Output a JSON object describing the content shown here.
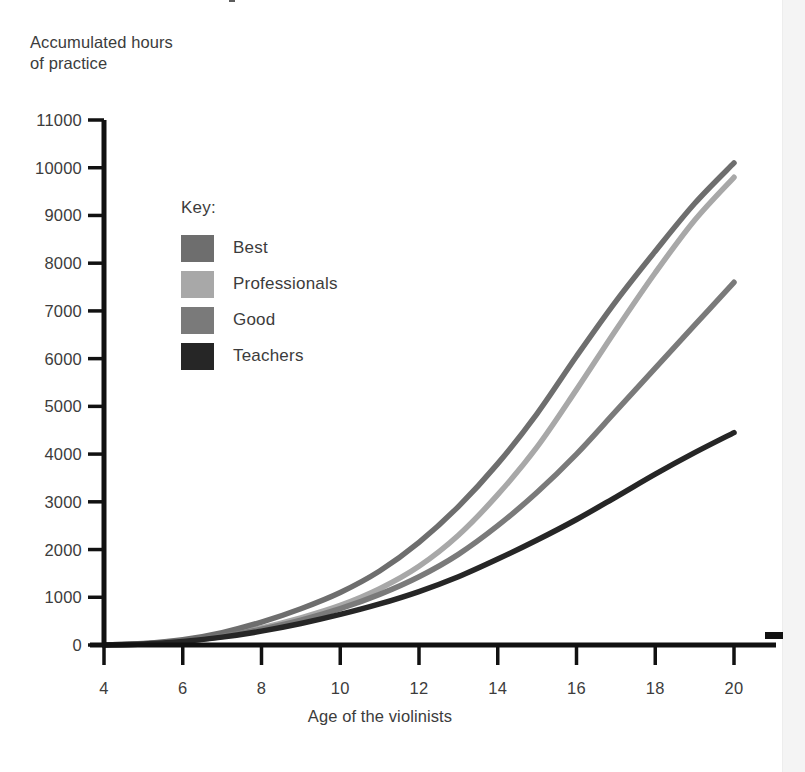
{
  "y_axis_title": "Accumulated hours\nof practice",
  "x_axis_title": "Age of the violinists",
  "legend": {
    "title": "Key:",
    "items": [
      {
        "label": "Best",
        "color": "#6e6e6e"
      },
      {
        "label": "Professionals",
        "color": "#a8a8a8"
      },
      {
        "label": "Good",
        "color": "#7a7a7a"
      },
      {
        "label": "Teachers",
        "color": "#262626"
      }
    ]
  },
  "colors": {
    "axis": "#111111",
    "text": "#3c3c3c",
    "background": "#ffffff",
    "gutter": "#f4f4f4"
  },
  "chart_data": {
    "type": "line",
    "title": "",
    "xlabel": "Age of the violinists",
    "ylabel": "Accumulated hours of practice",
    "xlim": [
      4,
      21
    ],
    "ylim": [
      0,
      11000
    ],
    "xticks": [
      4,
      6,
      8,
      10,
      12,
      14,
      16,
      18,
      20
    ],
    "yticks": [
      0,
      1000,
      2000,
      3000,
      4000,
      5000,
      6000,
      7000,
      8000,
      9000,
      10000,
      11000
    ],
    "grid": false,
    "legend_position": "upper-left-inside",
    "x": [
      4,
      5,
      6,
      7,
      8,
      9,
      10,
      11,
      12,
      13,
      14,
      15,
      16,
      17,
      18,
      19,
      20
    ],
    "series": [
      {
        "name": "Best",
        "color": "#6e6e6e",
        "values": [
          0,
          30,
          110,
          260,
          480,
          760,
          1100,
          1550,
          2150,
          2900,
          3800,
          4850,
          6050,
          7200,
          8250,
          9250,
          10100
        ]
      },
      {
        "name": "Professionals",
        "color": "#a8a8a8",
        "values": [
          0,
          25,
          90,
          200,
          360,
          570,
          830,
          1180,
          1650,
          2300,
          3150,
          4150,
          5350,
          6600,
          7800,
          8900,
          9800
        ]
      },
      {
        "name": "Good",
        "color": "#7a7a7a",
        "values": [
          0,
          20,
          80,
          180,
          330,
          520,
          760,
          1060,
          1430,
          1900,
          2500,
          3200,
          4000,
          4900,
          5800,
          6700,
          7600
        ]
      },
      {
        "name": "Teachers",
        "color": "#262626",
        "values": [
          0,
          20,
          75,
          165,
          290,
          450,
          640,
          860,
          1120,
          1430,
          1800,
          2200,
          2630,
          3100,
          3580,
          4030,
          4450
        ]
      }
    ]
  }
}
